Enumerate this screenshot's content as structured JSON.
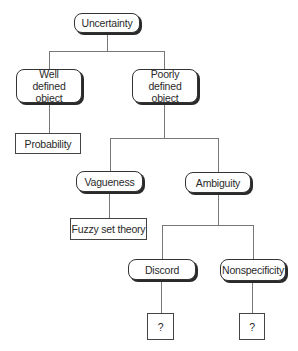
{
  "diagram": {
    "root": {
      "label": "Uncertainty"
    },
    "level1": [
      {
        "label": "Well defined object"
      },
      {
        "label": "Poorly defined object"
      }
    ],
    "well_defined_child": {
      "label": "Probability"
    },
    "poorly_defined_children": [
      {
        "label": "Vagueness"
      },
      {
        "label": "Ambiguity"
      }
    ],
    "vagueness_child": {
      "label": "Fuzzy set theory"
    },
    "ambiguity_children": [
      {
        "label": "Discord"
      },
      {
        "label": "Nonspecificity"
      }
    ],
    "discord_child": {
      "label": "?"
    },
    "nonspecificity_child": {
      "label": "?"
    }
  }
}
